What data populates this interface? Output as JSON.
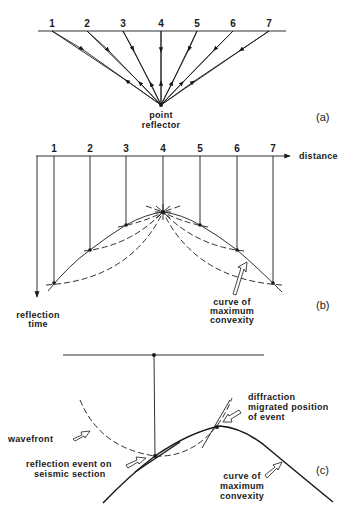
{
  "panel_a": {
    "label": "(a)",
    "stations": [
      "1",
      "2",
      "3",
      "4",
      "5",
      "6",
      "7"
    ],
    "reflector_label_line1": "point",
    "reflector_label_line2": "reflector"
  },
  "panel_b": {
    "label": "(b)",
    "stations": [
      "1",
      "2",
      "3",
      "4",
      "5",
      "6",
      "7"
    ],
    "x_axis_label": "distance",
    "y_axis_label_line1": "reflection",
    "y_axis_label_line2": "time",
    "curve_label_line1": "curve of",
    "curve_label_line2": "maximum",
    "curve_label_line3": "convexity"
  },
  "panel_c": {
    "label": "(c)",
    "wavefront_label": "wavefront",
    "reflection_label_line1": "reflection event on",
    "reflection_label_line2": "seismic section",
    "diffraction_label_line1": "diffraction",
    "diffraction_label_line2": "migrated position",
    "diffraction_label_line3": "of event",
    "curve_label_line1": "curve of",
    "curve_label_line2": "maximum",
    "curve_label_line3": "convexity"
  }
}
